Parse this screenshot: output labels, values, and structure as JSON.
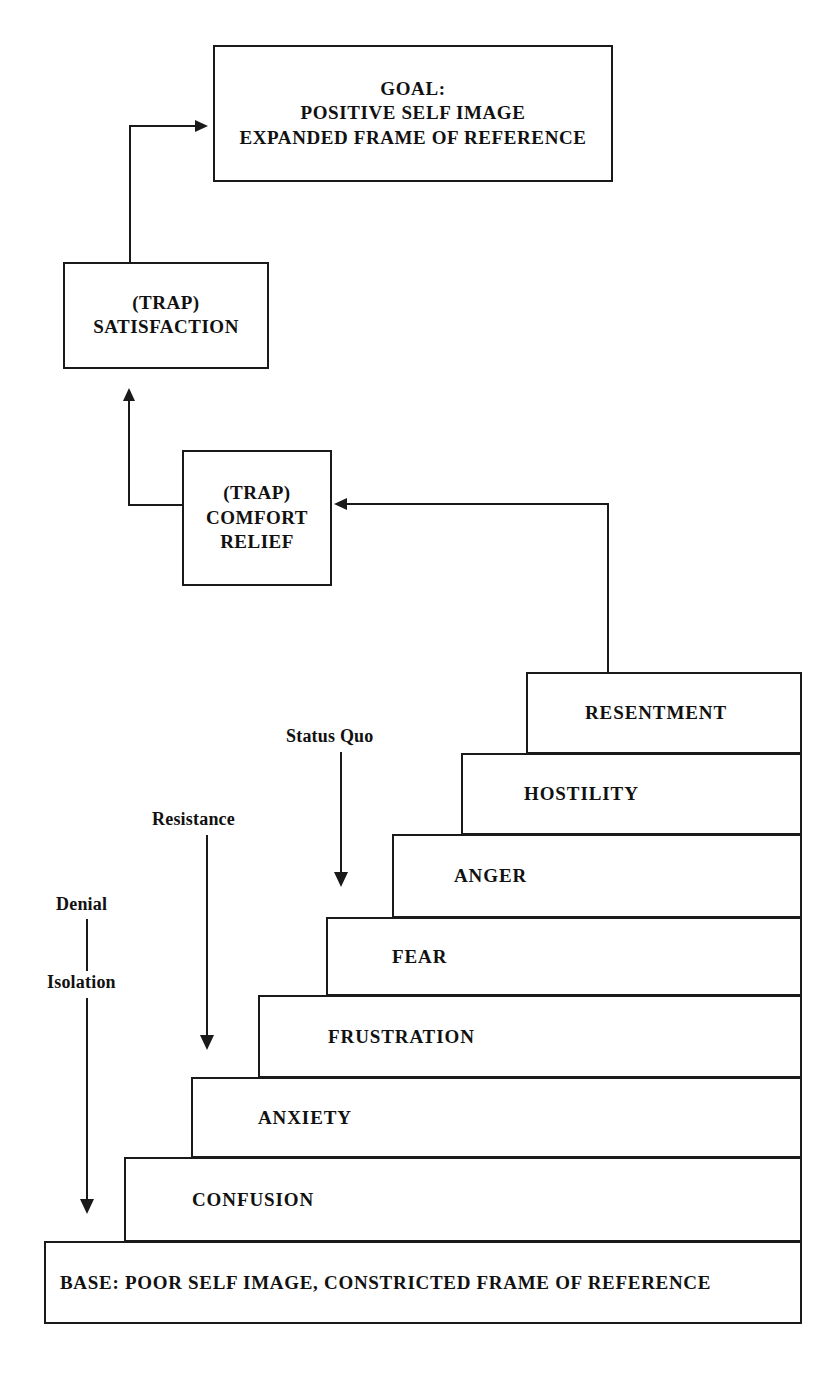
{
  "diagram": {
    "ink_color": "#1a1a1a",
    "background_color": "#ffffff"
  },
  "goal_box": {
    "line1": "GOAL:",
    "line2": "POSITIVE SELF IMAGE",
    "line3": "EXPANDED FRAME OF REFERENCE"
  },
  "trap_satisfaction": {
    "line1": "(TRAP)",
    "line2": "SATISFACTION"
  },
  "trap_comfort": {
    "line1": "(TRAP)",
    "line2": "COMFORT",
    "line3": "RELIEF"
  },
  "staircase": {
    "steps": [
      {
        "label": "RESENTMENT"
      },
      {
        "label": "HOSTILITY"
      },
      {
        "label": "ANGER"
      },
      {
        "label": "FEAR"
      },
      {
        "label": "FRUSTRATION"
      },
      {
        "label": "ANXIETY"
      },
      {
        "label": "CONFUSION"
      }
    ],
    "base": {
      "label": "BASE: POOR SELF IMAGE, CONSTRICTED FRAME OF REFERENCE"
    }
  },
  "annotations": [
    {
      "label": "Status Quo"
    },
    {
      "label": "Resistance"
    },
    {
      "label": "Denial"
    },
    {
      "label": "Isolation"
    }
  ]
}
